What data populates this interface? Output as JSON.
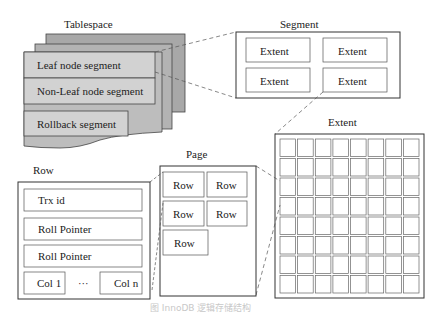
{
  "tablespace": {
    "title": "Tablespace",
    "segments": [
      "Leaf node segment",
      "Non-Leaf node segment",
      "Rollback segment"
    ],
    "colors": {
      "front": "#cfcfcf",
      "back": "#a8a8a8",
      "mid": "#b6b6b6"
    }
  },
  "segment": {
    "title": "Segment",
    "extents": [
      "Extent",
      "Extent",
      "Extent",
      "Extent"
    ]
  },
  "extent": {
    "title": "Extent",
    "rows": 8,
    "cols": 8
  },
  "page": {
    "title": "Page",
    "rows": [
      "Row",
      "Row",
      "Row",
      "Row",
      "Row"
    ]
  },
  "row": {
    "title": "Row",
    "fields": [
      "Trx id",
      "Roll Pointer",
      "Roll Pointer"
    ],
    "col_first": "Col 1",
    "col_ellipsis": "···",
    "col_last": "Col n"
  },
  "caption": "图        InnoDB 逻辑存储结构"
}
